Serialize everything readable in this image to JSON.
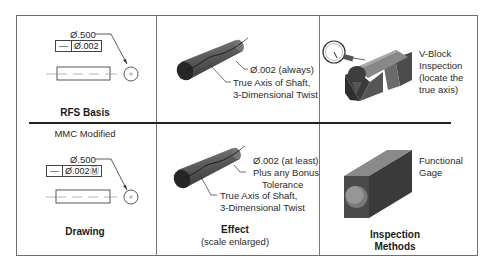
{
  "figure": {
    "columns": [
      "Drawing",
      "Effect",
      "Inspection Methods"
    ],
    "rfs_row": {
      "drawing": {
        "dimension": "Ø.500",
        "control_frame": {
          "symbol": "—",
          "tolerance": "Ø.002"
        },
        "caption": "RFS Basis"
      },
      "effect": {
        "callout_1": "Ø.002 (always)",
        "callout_2_line1": "True Axis of Shaft,",
        "callout_2_line2": "3-Dimensional Twist"
      },
      "inspection": {
        "label_line1": "V-Block",
        "label_line2": "Inspection",
        "label_line3": "(locate the",
        "label_line4": "true axis)"
      }
    },
    "mmc_row": {
      "section_label": "MMC Modified",
      "drawing": {
        "dimension": "Ø.500",
        "control_frame": {
          "symbol": "—",
          "tolerance": "Ø.002",
          "modifier": "Ⓜ"
        },
        "caption": "Drawing"
      },
      "effect": {
        "callout_1_line1": "Ø.002 (at least)",
        "callout_1_line2": "Plus any Bonus",
        "callout_1_line3": "Tolerance",
        "callout_2_line1": "True Axis of Shaft,",
        "callout_2_line2": "3-Dimensional Twist",
        "caption": "Effect",
        "subcaption": "(scale enlarged)"
      },
      "inspection": {
        "label_line1": "Functional",
        "label_line2": "Gage",
        "caption_line1": "Inspection",
        "caption_line2": "Methods"
      }
    },
    "colors": {
      "border": "#6e6e6e",
      "divider": "#222222",
      "shaft_dark": "#2b2b2b",
      "shaft_mid": "#6a6a6a"
    }
  }
}
